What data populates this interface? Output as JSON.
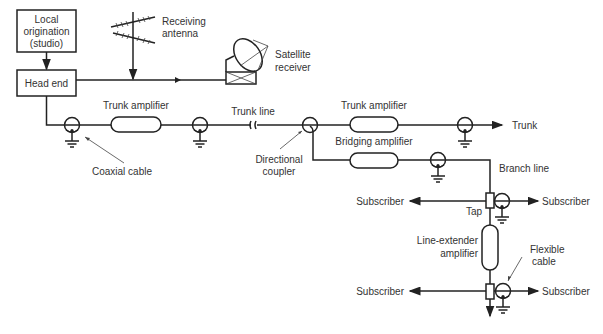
{
  "diagram": {
    "colors": {
      "line": "#222222",
      "text": "#333333",
      "background": "#ffffff"
    },
    "blocks": {
      "local_origination": [
        "Local",
        "origination",
        "(studio)"
      ],
      "head_end": "Head end"
    },
    "labels": {
      "receiving_antenna": [
        "Receiving",
        "antenna"
      ],
      "satellite_receiver": [
        "Satellite",
        "receiver"
      ],
      "trunk_amplifier_1": "Trunk amplifier",
      "trunk_line": "Trunk line",
      "trunk_amplifier_2": "Trunk amplifier",
      "trunk": "Trunk",
      "coaxial_cable": "Coaxial cable",
      "directional_coupler": [
        "Directional",
        "coupler"
      ],
      "bridging_amplifier": "Bridging amplifier",
      "branch_line": "Branch line",
      "tap": "Tap",
      "line_extender": [
        "Line-extender",
        "amplifier"
      ],
      "flexible_cable": [
        "Flexible",
        "cable"
      ],
      "subscriber_left_1": "Subscriber",
      "subscriber_right_1": "Subscriber",
      "subscriber_left_2": "Subscriber",
      "subscriber_right_2": "Subscriber"
    }
  }
}
